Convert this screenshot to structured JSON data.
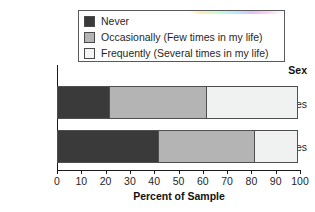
{
  "chart_data": {
    "type": "bar",
    "orientation": "horizontal",
    "stacked": true,
    "title": "",
    "xlabel": "Percent of Sample",
    "ylabel": "Sex",
    "xlim": [
      0,
      100
    ],
    "xticks": [
      0,
      10,
      20,
      30,
      40,
      50,
      60,
      70,
      80,
      90,
      100
    ],
    "grid": false,
    "legend_position": "top",
    "categories": [
      "Males",
      "Females"
    ],
    "series": [
      {
        "name": "Never",
        "values": [
          22,
          42
        ],
        "color": "#3a3a3a"
      },
      {
        "name": "Occasionally (Few times in my life)",
        "values": [
          40,
          40
        ],
        "color": "#b4b4b4"
      },
      {
        "name": "Frequently (Several times in my life)",
        "values": [
          38,
          18
        ],
        "color": "#f0f2f2"
      }
    ],
    "segment_boundaries": {
      "Males": [
        0,
        22,
        62,
        100
      ],
      "Females": [
        0,
        42,
        82,
        100
      ]
    }
  },
  "legend": {
    "items": [
      {
        "label": "Never",
        "swatch": "#3a3a3a"
      },
      {
        "label": "Occasionally (Few times in my life)",
        "swatch": "#b4b4b4"
      },
      {
        "label": "Frequently (Several times in my life)",
        "swatch": "#f4f6f6"
      }
    ]
  },
  "axes": {
    "y_title": "Sex",
    "y_categories": [
      "Males",
      "Females"
    ],
    "x_title": "Percent of Sample",
    "x_ticks": [
      "0",
      "10",
      "20",
      "30",
      "40",
      "50",
      "60",
      "70",
      "80",
      "90",
      "100"
    ]
  }
}
